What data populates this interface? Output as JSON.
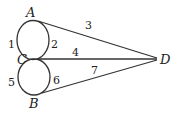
{
  "diagram": {
    "type": "graph",
    "nodes": [
      {
        "id": "A",
        "label": "A",
        "x": 36,
        "y": 20
      },
      {
        "id": "C",
        "label": "C",
        "x": 38,
        "y": 59
      },
      {
        "id": "B",
        "label": "B",
        "x": 42,
        "y": 94
      },
      {
        "id": "D",
        "label": "D",
        "x": 158,
        "y": 59
      }
    ],
    "edges": [
      {
        "id": "1",
        "label": "1",
        "from": "A",
        "to": "C",
        "shape": "left-arc"
      },
      {
        "id": "2",
        "label": "2",
        "from": "A",
        "to": "C",
        "shape": "right-arc"
      },
      {
        "id": "3",
        "label": "3",
        "from": "A",
        "to": "D",
        "shape": "line"
      },
      {
        "id": "4",
        "label": "4",
        "from": "C",
        "to": "D",
        "shape": "line"
      },
      {
        "id": "5",
        "label": "5",
        "from": "C",
        "to": "B",
        "shape": "left-arc"
      },
      {
        "id": "6",
        "label": "6",
        "from": "C",
        "to": "B",
        "shape": "right-arc"
      },
      {
        "id": "7",
        "label": "7",
        "from": "B",
        "to": "D",
        "shape": "line"
      }
    ],
    "colors": {
      "stroke": "#333333",
      "text": "#222222",
      "background": "#ffffff"
    }
  }
}
